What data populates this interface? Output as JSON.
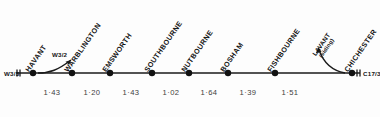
{
  "diagram": {
    "type": "railway-strip-map",
    "line_color": "#1a1a1a",
    "text_color": "#121212",
    "distance_text_color": "#404040",
    "background": "#fdfdfd"
  },
  "stations": [
    {
      "name": "HAVANT",
      "x": 33,
      "label_x": 30,
      "label_y": 66
    },
    {
      "name": "WARBLINGTON",
      "x": 72,
      "label_x": 69,
      "label_y": 66
    },
    {
      "name": "EMSWORTH",
      "x": 110,
      "label_x": 107,
      "label_y": 66
    },
    {
      "name": "SOUTHBOURNE",
      "x": 152,
      "label_x": 149,
      "label_y": 66
    },
    {
      "name": "NUTBOURNE",
      "x": 189,
      "label_x": 186,
      "label_y": 66
    },
    {
      "name": "BOSHAM",
      "x": 228,
      "label_x": 225,
      "label_y": 66
    },
    {
      "name": "FISHBOURNE",
      "x": 275,
      "label_x": 272,
      "label_y": 66
    },
    {
      "name": "CHICHESTER",
      "x": 352,
      "label_x": 349,
      "label_y": 66
    }
  ],
  "branches": [
    {
      "name": "W3/2",
      "label": "W3/2",
      "label_x": 52,
      "label_y": 51,
      "attaches_to": "HAVANT",
      "arrow_direction": "up-right"
    },
    {
      "name": "LAVANT (siding)",
      "label": "LAVANT",
      "sublabel": "(siding)",
      "label_x": 322,
      "label_y": 44,
      "attaches_to": "CHICHESTER",
      "arrow_direction": "up-left"
    }
  ],
  "terminals": [
    {
      "name": "W3/3",
      "label": "W3/3",
      "side": "left",
      "x": 6,
      "y": 70
    },
    {
      "name": "C17/3",
      "label": "C17/3",
      "side": "right",
      "x": 362,
      "y": 70
    }
  ],
  "distances": [
    {
      "label": "1·43",
      "from": "HAVANT",
      "to": "WARBLINGTON",
      "x": 52,
      "y": 92
    },
    {
      "label": "1·20",
      "from": "WARBLINGTON",
      "to": "EMSWORTH",
      "x": 92,
      "y": 92
    },
    {
      "label": "1·43",
      "from": "EMSWORTH",
      "to": "SOUTHBOURNE",
      "x": 131,
      "y": 92
    },
    {
      "label": "1·02",
      "from": "SOUTHBOURNE",
      "to": "NUTBOURNE",
      "x": 171,
      "y": 92
    },
    {
      "label": "1·64",
      "from": "NUTBOURNE",
      "to": "BOSHAM",
      "x": 209,
      "y": 92
    },
    {
      "label": "1·39",
      "from": "BOSHAM",
      "to": "FISHBOURNE",
      "x": 248,
      "y": 92
    },
    {
      "label": "1·51",
      "from": "FISHBOURNE",
      "to": "CHICHESTER",
      "x": 290,
      "y": 92
    }
  ],
  "geometry": {
    "baseline_y": 73,
    "line_start_x": 16,
    "line_end_x": 360,
    "dot_radius": 3.2
  }
}
